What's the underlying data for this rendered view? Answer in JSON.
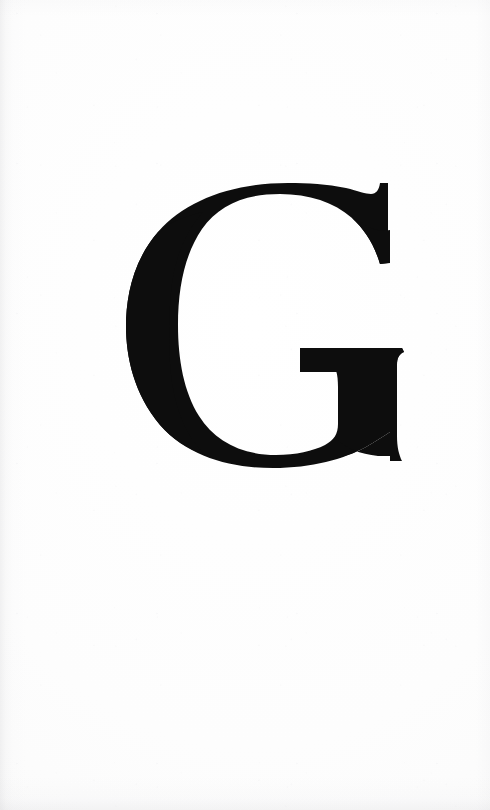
{
  "page": {
    "kind": "scanned-book-page",
    "width": 490,
    "height": 810,
    "background_color": "#fdfdfd",
    "paper_tone": "#fbfbfb",
    "orientation": "portrait",
    "content_description": "Large serif capital letter G centered in the upper portion of a blank page",
    "header_text": "",
    "footer_text": "",
    "page_number": ""
  },
  "glyph": {
    "character": "G",
    "name": "capital-letter-g",
    "style": "old-style serif",
    "ink_color": "#0d0d0d",
    "bounds": {
      "x": 126,
      "y": 183,
      "width": 276,
      "height": 285
    },
    "features": {
      "crossbar": "horizontal bar entering from right at mid-height",
      "terminal": "beak terminal at upper right",
      "spur": "none at baseline",
      "stroke_contrast": "moderate, thick left stem, thin top and bottom curves"
    }
  }
}
